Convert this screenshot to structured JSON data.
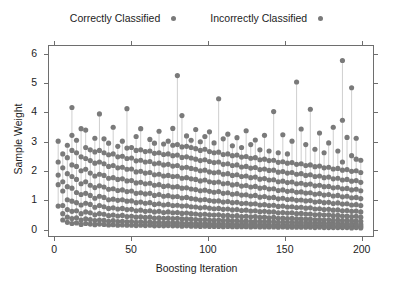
{
  "chart_data": {
    "type": "scatter",
    "title": "",
    "xlabel": "Boosting Iteration",
    "ylabel": "Sample Weight",
    "xlim": [
      -4,
      208
    ],
    "ylim": [
      -0.25,
      6.3
    ],
    "xticks": [
      0,
      50,
      100,
      150,
      200
    ],
    "yticks": [
      0,
      1,
      2,
      3,
      4,
      5,
      6
    ],
    "grid": false,
    "legend_position": "top-center",
    "frame": "box-all-sides-outward-ticks",
    "point_color": "#7a7a7a",
    "point_radius": 2.6,
    "stem_color": "#c9c9c9",
    "series": [
      {
        "name": "Correctly Classified",
        "color": "#7a7a7a",
        "marker": "circle"
      },
      {
        "name": "Incorrectly Classified",
        "color": "#7a7a7a",
        "marker": "circle"
      }
    ],
    "columns": [
      {
        "x": 2,
        "values": [
          0.78,
          1.52,
          1.85,
          2.3,
          3.02
        ]
      },
      {
        "x": 5,
        "values": [
          0.3,
          0.52,
          0.8,
          1.3,
          1.62,
          2.1,
          2.58
        ]
      },
      {
        "x": 8,
        "values": [
          0.22,
          0.4,
          0.66,
          1.0,
          1.45,
          1.9,
          2.45,
          2.88
        ]
      },
      {
        "x": 11,
        "values": [
          0.18,
          0.35,
          0.6,
          0.95,
          1.4,
          1.8,
          2.2,
          2.7,
          3.22,
          4.18
        ]
      },
      {
        "x": 14,
        "values": [
          0.2,
          0.38,
          0.62,
          0.9,
          1.25,
          1.7,
          2.15,
          2.62,
          3.05
        ]
      },
      {
        "x": 17,
        "values": [
          0.15,
          0.3,
          0.52,
          0.82,
          1.18,
          1.55,
          2.0,
          2.48,
          3.45
        ]
      },
      {
        "x": 20,
        "values": [
          0.18,
          0.34,
          0.58,
          0.88,
          1.22,
          1.62,
          2.05,
          2.42,
          2.8,
          3.4
        ]
      },
      {
        "x": 23,
        "values": [
          0.16,
          0.32,
          0.55,
          0.84,
          1.15,
          1.5,
          1.92,
          2.35,
          2.72
        ]
      },
      {
        "x": 26,
        "values": [
          0.14,
          0.28,
          0.48,
          0.74,
          1.05,
          1.42,
          1.82,
          2.26,
          2.65,
          3.12
        ]
      },
      {
        "x": 29,
        "values": [
          0.16,
          0.3,
          0.52,
          0.8,
          1.12,
          1.48,
          1.88,
          2.3,
          2.7,
          3.96
        ]
      },
      {
        "x": 32,
        "values": [
          0.15,
          0.29,
          0.5,
          0.76,
          1.08,
          1.44,
          1.84,
          2.24,
          2.62,
          3.1
        ]
      },
      {
        "x": 35,
        "values": [
          0.13,
          0.26,
          0.45,
          0.7,
          1.0,
          1.36,
          1.74,
          2.15,
          2.55,
          2.95
        ]
      },
      {
        "x": 38,
        "values": [
          0.14,
          0.28,
          0.47,
          0.72,
          1.02,
          1.38,
          1.76,
          2.18,
          2.58,
          3.5
        ]
      },
      {
        "x": 41,
        "values": [
          0.12,
          0.25,
          0.44,
          0.68,
          0.98,
          1.32,
          1.7,
          2.1,
          2.48,
          2.84
        ]
      },
      {
        "x": 44,
        "values": [
          0.13,
          0.26,
          0.46,
          0.7,
          1.0,
          1.34,
          1.72,
          2.12,
          2.5,
          3.02
        ]
      },
      {
        "x": 47,
        "values": [
          0.12,
          0.24,
          0.42,
          0.66,
          0.95,
          1.28,
          1.65,
          2.05,
          2.42,
          2.78,
          4.14
        ]
      },
      {
        "x": 50,
        "values": [
          0.12,
          0.25,
          0.43,
          0.67,
          0.96,
          1.3,
          1.66,
          2.06,
          2.44,
          2.8
        ]
      },
      {
        "x": 53,
        "values": [
          0.11,
          0.22,
          0.4,
          0.62,
          0.9,
          1.22,
          1.58,
          1.96,
          2.34,
          2.7,
          3.18
        ]
      },
      {
        "x": 56,
        "values": [
          0.12,
          0.24,
          0.41,
          0.64,
          0.92,
          1.24,
          1.6,
          1.98,
          2.36,
          2.72,
          3.45
        ]
      },
      {
        "x": 59,
        "values": [
          0.11,
          0.22,
          0.39,
          0.6,
          0.88,
          1.2,
          1.55,
          1.92,
          2.3,
          2.66
        ]
      },
      {
        "x": 62,
        "values": [
          0.12,
          0.23,
          0.4,
          0.62,
          0.9,
          1.22,
          1.57,
          1.94,
          2.32,
          2.68,
          3.08
        ]
      },
      {
        "x": 65,
        "values": [
          0.1,
          0.21,
          0.37,
          0.58,
          0.84,
          1.15,
          1.5,
          1.86,
          2.24,
          2.6,
          2.95
        ]
      },
      {
        "x": 68,
        "values": [
          0.11,
          0.22,
          0.38,
          0.6,
          0.86,
          1.18,
          1.52,
          1.88,
          2.26,
          2.62,
          3.36
        ]
      },
      {
        "x": 71,
        "values": [
          0.1,
          0.2,
          0.36,
          0.56,
          0.82,
          1.12,
          1.46,
          1.82,
          2.2,
          2.56,
          2.92
        ]
      },
      {
        "x": 74,
        "values": [
          0.11,
          0.21,
          0.37,
          0.58,
          0.84,
          1.14,
          1.48,
          1.84,
          2.22,
          2.58,
          3.02
        ]
      },
      {
        "x": 77,
        "values": [
          0.1,
          0.2,
          0.35,
          0.55,
          0.8,
          1.1,
          1.44,
          1.8,
          2.16,
          2.52,
          2.88,
          3.46
        ]
      },
      {
        "x": 80,
        "values": [
          0.1,
          0.2,
          0.36,
          0.56,
          0.81,
          1.11,
          1.45,
          1.81,
          2.18,
          2.54,
          2.9,
          5.28
        ]
      },
      {
        "x": 83,
        "values": [
          0.09,
          0.19,
          0.34,
          0.53,
          0.78,
          1.06,
          1.4,
          1.74,
          2.1,
          2.46,
          2.82,
          3.9
        ]
      },
      {
        "x": 86,
        "values": [
          0.1,
          0.19,
          0.34,
          0.54,
          0.79,
          1.08,
          1.41,
          1.76,
          2.12,
          2.48,
          2.84,
          3.2
        ]
      },
      {
        "x": 89,
        "values": [
          0.09,
          0.18,
          0.33,
          0.52,
          0.76,
          1.04,
          1.37,
          1.72,
          2.08,
          2.44,
          2.8,
          3.05
        ]
      },
      {
        "x": 92,
        "values": [
          0.09,
          0.18,
          0.32,
          0.51,
          0.75,
          1.02,
          1.35,
          1.7,
          2.05,
          2.4,
          2.76,
          3.42
        ]
      },
      {
        "x": 95,
        "values": [
          0.08,
          0.17,
          0.31,
          0.49,
          0.72,
          0.99,
          1.31,
          1.65,
          2.0,
          2.35,
          2.7,
          3.0
        ]
      },
      {
        "x": 98,
        "values": [
          0.09,
          0.18,
          0.32,
          0.5,
          0.74,
          1.01,
          1.33,
          1.68,
          2.02,
          2.38,
          2.74,
          3.18
        ]
      },
      {
        "x": 101,
        "values": [
          0.08,
          0.17,
          0.3,
          0.48,
          0.71,
          0.97,
          1.29,
          1.62,
          1.96,
          2.32,
          2.66,
          3.34
        ]
      },
      {
        "x": 104,
        "values": [
          0.08,
          0.16,
          0.29,
          0.47,
          0.69,
          0.95,
          1.26,
          1.59,
          1.93,
          2.28,
          2.62,
          2.96
        ]
      },
      {
        "x": 107,
        "values": [
          0.08,
          0.17,
          0.3,
          0.48,
          0.7,
          0.96,
          1.28,
          1.61,
          1.95,
          2.3,
          2.64,
          4.48
        ]
      },
      {
        "x": 110,
        "values": [
          0.07,
          0.16,
          0.28,
          0.45,
          0.67,
          0.92,
          1.22,
          1.55,
          1.88,
          2.22,
          2.56,
          3.1
        ]
      },
      {
        "x": 113,
        "values": [
          0.08,
          0.16,
          0.29,
          0.46,
          0.68,
          0.94,
          1.24,
          1.57,
          1.9,
          2.24,
          2.58,
          3.26
        ]
      },
      {
        "x": 116,
        "values": [
          0.07,
          0.15,
          0.27,
          0.44,
          0.65,
          0.9,
          1.19,
          1.51,
          1.84,
          2.18,
          2.52,
          2.86
        ]
      },
      {
        "x": 119,
        "values": [
          0.07,
          0.15,
          0.28,
          0.45,
          0.66,
          0.91,
          1.21,
          1.53,
          1.86,
          2.2,
          2.54,
          3.14
        ]
      },
      {
        "x": 122,
        "values": [
          0.07,
          0.14,
          0.26,
          0.42,
          0.63,
          0.87,
          1.16,
          1.47,
          1.8,
          2.13,
          2.47,
          2.8
        ]
      },
      {
        "x": 125,
        "values": [
          0.07,
          0.15,
          0.27,
          0.43,
          0.64,
          0.88,
          1.17,
          1.49,
          1.82,
          2.15,
          2.49,
          3.38
        ]
      },
      {
        "x": 128,
        "values": [
          0.06,
          0.14,
          0.25,
          0.41,
          0.61,
          0.85,
          1.13,
          1.44,
          1.76,
          2.09,
          2.43,
          2.9
        ]
      },
      {
        "x": 131,
        "values": [
          0.07,
          0.14,
          0.26,
          0.42,
          0.62,
          0.86,
          1.15,
          1.46,
          1.78,
          2.11,
          2.45,
          3.06
        ]
      },
      {
        "x": 134,
        "values": [
          0.06,
          0.13,
          0.24,
          0.39,
          0.59,
          0.82,
          1.09,
          1.4,
          1.71,
          2.04,
          2.38,
          2.72
        ]
      },
      {
        "x": 137,
        "values": [
          0.06,
          0.14,
          0.25,
          0.4,
          0.6,
          0.83,
          1.11,
          1.42,
          1.73,
          2.06,
          2.4,
          3.22
        ]
      },
      {
        "x": 140,
        "values": [
          0.06,
          0.13,
          0.24,
          0.38,
          0.58,
          0.8,
          1.07,
          1.37,
          1.68,
          2.01,
          2.35,
          2.68
        ]
      },
      {
        "x": 143,
        "values": [
          0.06,
          0.13,
          0.24,
          0.39,
          0.58,
          0.81,
          1.08,
          1.38,
          1.69,
          2.02,
          2.36,
          4.04
        ]
      },
      {
        "x": 146,
        "values": [
          0.05,
          0.12,
          0.22,
          0.36,
          0.55,
          0.77,
          1.03,
          1.32,
          1.62,
          1.95,
          2.29,
          2.62
        ]
      },
      {
        "x": 149,
        "values": [
          0.06,
          0.12,
          0.23,
          0.37,
          0.56,
          0.78,
          1.05,
          1.34,
          1.64,
          1.97,
          2.31,
          3.24
        ]
      },
      {
        "x": 152,
        "values": [
          0.05,
          0.12,
          0.22,
          0.35,
          0.54,
          0.75,
          1.01,
          1.29,
          1.59,
          1.92,
          2.26,
          2.58
        ]
      },
      {
        "x": 155,
        "values": [
          0.05,
          0.12,
          0.22,
          0.36,
          0.55,
          0.76,
          1.02,
          1.31,
          1.61,
          1.94,
          2.28,
          3.02
        ]
      },
      {
        "x": 158,
        "values": [
          0.05,
          0.11,
          0.21,
          0.34,
          0.52,
          0.73,
          0.98,
          1.26,
          1.55,
          1.88,
          2.22,
          5.06
        ]
      },
      {
        "x": 161,
        "values": [
          0.05,
          0.11,
          0.21,
          0.34,
          0.53,
          0.74,
          0.99,
          1.27,
          1.57,
          1.9,
          2.24,
          3.44
        ]
      },
      {
        "x": 164,
        "values": [
          0.05,
          0.11,
          0.2,
          0.33,
          0.51,
          0.71,
          0.96,
          1.23,
          1.52,
          1.84,
          2.18,
          2.9
        ]
      },
      {
        "x": 167,
        "values": [
          0.05,
          0.11,
          0.2,
          0.33,
          0.51,
          0.72,
          0.97,
          1.24,
          1.54,
          1.86,
          2.2,
          4.12
        ]
      },
      {
        "x": 170,
        "values": [
          0.04,
          0.1,
          0.19,
          0.31,
          0.48,
          0.68,
          0.92,
          1.19,
          1.48,
          1.8,
          2.14,
          2.74
        ]
      },
      {
        "x": 173,
        "values": [
          0.05,
          0.1,
          0.2,
          0.32,
          0.49,
          0.69,
          0.94,
          1.21,
          1.5,
          1.82,
          2.16,
          3.3
        ]
      },
      {
        "x": 176,
        "values": [
          0.04,
          0.1,
          0.18,
          0.3,
          0.47,
          0.66,
          0.9,
          1.16,
          1.45,
          1.76,
          2.1,
          2.62
        ]
      },
      {
        "x": 179,
        "values": [
          0.04,
          0.1,
          0.19,
          0.31,
          0.48,
          0.67,
          0.91,
          1.18,
          1.46,
          1.78,
          2.12,
          2.96
        ]
      },
      {
        "x": 182,
        "values": [
          0.04,
          0.09,
          0.18,
          0.29,
          0.45,
          0.64,
          0.87,
          1.13,
          1.41,
          1.72,
          2.06,
          3.5
        ]
      },
      {
        "x": 185,
        "values": [
          0.04,
          0.09,
          0.18,
          0.3,
          0.46,
          0.65,
          0.89,
          1.15,
          1.43,
          1.74,
          2.08,
          2.68
        ]
      },
      {
        "x": 188,
        "values": [
          0.04,
          0.09,
          0.17,
          0.28,
          0.44,
          0.62,
          0.85,
          1.1,
          1.38,
          1.68,
          2.02,
          2.3,
          3.74,
          5.8
        ]
      },
      {
        "x": 191,
        "values": [
          0.04,
          0.09,
          0.17,
          0.29,
          0.44,
          0.63,
          0.86,
          1.12,
          1.39,
          1.7,
          2.04,
          3.15
        ]
      },
      {
        "x": 194,
        "values": [
          0.03,
          0.08,
          0.16,
          0.27,
          0.42,
          0.6,
          0.82,
          1.07,
          1.34,
          1.64,
          1.98,
          2.52,
          4.86
        ]
      },
      {
        "x": 197,
        "values": [
          0.04,
          0.08,
          0.16,
          0.27,
          0.43,
          0.61,
          0.83,
          1.08,
          1.36,
          1.66,
          2.0,
          2.4,
          3.12
        ]
      },
      {
        "x": 200,
        "values": [
          0.03,
          0.08,
          0.15,
          0.26,
          0.4,
          0.58,
          0.8,
          1.04,
          1.31,
          1.6,
          1.94,
          2.36
        ]
      }
    ]
  },
  "legend": {
    "entries": [
      {
        "label": "Correctly Classified",
        "color": "#7a7a7a"
      },
      {
        "label": "Incorrectly Classified",
        "color": "#7a7a7a"
      }
    ]
  },
  "axes": {
    "x_title": "Boosting Iteration",
    "y_title": "Sample Weight",
    "x_tick_labels": [
      "0",
      "50",
      "100",
      "150",
      "200"
    ],
    "y_tick_labels": [
      "0",
      "1",
      "2",
      "3",
      "4",
      "5",
      "6"
    ]
  }
}
